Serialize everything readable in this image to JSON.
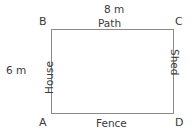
{
  "diagram": {
    "shape": "rectangle",
    "line_color": "#8a8a8a",
    "text_color": "#3a3a3a",
    "background": "#ffffff",
    "corners": {
      "top_left": "B",
      "top_right": "C",
      "bottom_left": "A",
      "bottom_right": "D"
    },
    "dimensions": {
      "top": "8 m",
      "left": "6 m"
    },
    "sides": {
      "top": "Path",
      "bottom": "Fence",
      "left": "House",
      "right": "Shed"
    }
  }
}
